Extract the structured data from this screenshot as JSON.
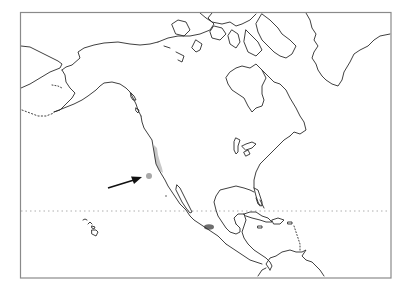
{
  "map": {
    "type": "species-range-map",
    "region": "North America and Central America",
    "projection_frame": {
      "left": 20,
      "top": 12,
      "right": 391,
      "bottom": 278
    },
    "reference_line": {
      "name": "Tropic of Cancer",
      "style": "dotted",
      "y": 211
    },
    "colors": {
      "background": "#ffffff",
      "coastline": "#2a2a2a",
      "frame": "#8a8a8a",
      "range_light": "#c8c8c8",
      "range_dark": "#6e6e6e",
      "point_marker": "#a8a8a8",
      "arrow": "#111111"
    },
    "features": {
      "range_west_coast": {
        "label": "Light grey range along Pacific coast (California)",
        "color": "#c8c8c8"
      },
      "range_mexico": {
        "label": "Dark grey range in western Mexico",
        "color": "#6e6e6e"
      },
      "offshore_point": {
        "label": "Isolated offshore occurrence point",
        "x": 149,
        "y": 176
      },
      "arrow": {
        "label": "Arrow pointing to offshore occurrence",
        "from": [
          108,
          188
        ],
        "to": [
          141,
          178
        ]
      }
    }
  }
}
